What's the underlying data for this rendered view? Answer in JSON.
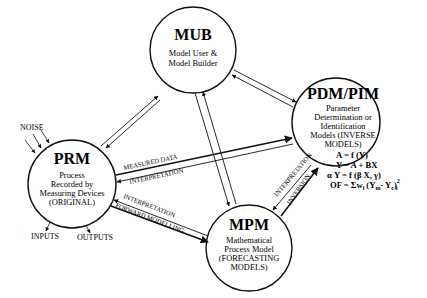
{
  "diagram": {
    "nodes": {
      "mub": {
        "title": "MUB",
        "lines": [
          "Model User &",
          "Model Builder"
        ]
      },
      "pdm": {
        "title": "PDM/PIM",
        "lines": [
          "Parameter",
          "Determination or",
          "Identification",
          "Models (INVERSE",
          "MODELS)"
        ]
      },
      "prm": {
        "title": "PRM",
        "lines": [
          "Process",
          "Recorded by",
          "Measuring Devices",
          "(ORIGINAL)"
        ]
      },
      "mpm": {
        "title": "MPM",
        "lines": [
          "Mathematical",
          "Process Model",
          "(FORECASTING",
          "MODELS)"
        ]
      }
    },
    "labels": {
      "noise": "NOISE",
      "inputs": "INPUTS",
      "outputs": "OUTPUTS",
      "measured_data": "MEASURED DATA",
      "interpretation_prm_pdm": "INTERPRETATION",
      "interpretation_prm_mpm": "INTERPRETATION",
      "forward_modelling": "FORWARD MODELLING",
      "interpretation_mpm_pdm": "INTERPRETATION",
      "inversion": "INVERSION"
    },
    "equations": [
      "A  =  f  (Y)",
      "Y  =  A  +  BX",
      "α Y  =  f  (β X, γ)",
      "OF  =  Σw",
      "i",
      "(Y",
      "m",
      "-  Y",
      "c",
      ")",
      "2",
      "i"
    ]
  }
}
